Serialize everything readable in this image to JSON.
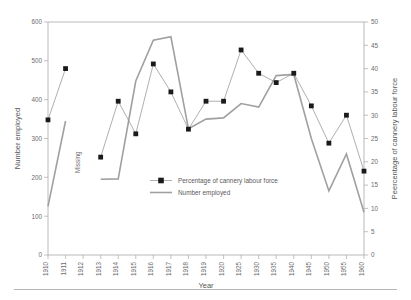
{
  "chart_data": {
    "type": "line",
    "title": "",
    "xlabel": "Year",
    "ylabel": "Number employed",
    "y2label": "Peercentage of cannery labour force",
    "ylim": [
      0,
      600
    ],
    "y2lim": [
      0,
      50
    ],
    "grid": false,
    "legend_position": "center",
    "categories": [
      "1910",
      "1911",
      "1912",
      "1913",
      "1914",
      "1915",
      "1916",
      "1917",
      "1918",
      "1919",
      "1920",
      "1925",
      "1930",
      "1935",
      "1940",
      "1945",
      "1950",
      "1955",
      "1960"
    ],
    "y_ticks": [
      "0",
      "100",
      "200",
      "300",
      "400",
      "500",
      "600"
    ],
    "y2_ticks": [
      "0",
      "5",
      "10",
      "15",
      "20",
      "25",
      "30",
      "35",
      "40",
      "45",
      "50"
    ],
    "series": [
      {
        "name": "Percentage of cannery labour force",
        "axis": "right",
        "marker": "square",
        "color": "#1a1a1a",
        "line_color": "#8c8c8c",
        "values": [
          29,
          40,
          null,
          21,
          33,
          26,
          41,
          35,
          27,
          33,
          33,
          44,
          39,
          37,
          39,
          32,
          24,
          30,
          18
        ]
      },
      {
        "name": "Number employed",
        "axis": "left",
        "marker": "none",
        "color": "#a0a0a0",
        "line_color": "#a0a0a0",
        "values": [
          125,
          345,
          null,
          195,
          196,
          448,
          553,
          562,
          325,
          350,
          353,
          390,
          381,
          462,
          465,
          300,
          165,
          260,
          110
        ]
      }
    ],
    "annotations": [
      {
        "text": "Missing",
        "x_category": "1912",
        "orientation": "vertical"
      }
    ]
  },
  "legend": {
    "items": [
      {
        "label": "Percentage of cannery labour force",
        "marker": "square-line"
      },
      {
        "label": "Number employed",
        "marker": "line"
      }
    ]
  },
  "axes": {
    "left_title": "Number employed",
    "right_title": "Peercentage of cannery labour force",
    "bottom_title": "Year"
  }
}
